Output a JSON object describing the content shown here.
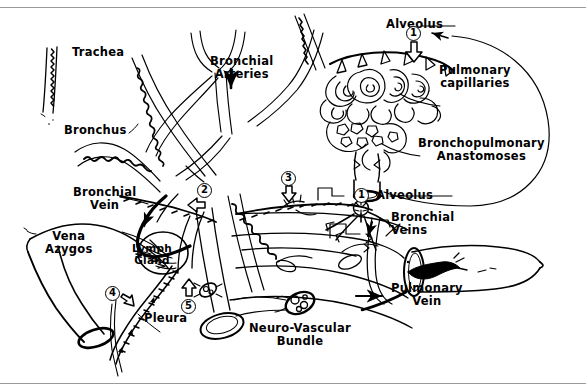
{
  "figure": {
    "kind": "anatomical-line-diagram",
    "stroke_color": "#000000",
    "background_color": "#ffffff",
    "rule_color": "#9a9a9a"
  },
  "labels": {
    "trachea": "Trachea",
    "bronchus": "Bronchus",
    "bronchial_arteries": "Bronchial\nArteries",
    "bronchial_vein": "Bronchial\nVein",
    "vena_azygos": "Vena\nAzygos",
    "lymph_gland": "Lymph\nGland",
    "pleura": "Pleura",
    "neuro_vascular_bundle": "Neuro-Vascular\nBundle",
    "alveolus_top": "Alveolus",
    "alveolus_mid": "Alveolus",
    "pulmonary_capillaries": "Pulmonary\ncapillaries",
    "bronchopulmonary_anastomoses": "Bronchopulmonary\nAnastomoses",
    "bronchial_veins": "Bronchial\nVeins",
    "pulmonary_vein": "Pulmonary\nVein"
  },
  "callouts": [
    {
      "id": "callout-1-top",
      "number": "1",
      "refers_to": "Alveolus"
    },
    {
      "id": "callout-1-mid",
      "number": "1",
      "refers_to": "Alveolus"
    },
    {
      "id": "callout-2",
      "number": "2",
      "refers_to": "Bronchial arterial supply to bronchial wall"
    },
    {
      "id": "callout-3",
      "number": "3",
      "refers_to": "Bronchial artery branch along bronchus"
    },
    {
      "id": "callout-4",
      "number": "4",
      "refers_to": "Pleural supply"
    },
    {
      "id": "callout-5",
      "number": "5",
      "refers_to": "Lymphatic drainage to lymph gland"
    }
  ],
  "icons": {
    "flow_arrow": "arrow-icon",
    "open_arrow": "open-arrow-icon"
  }
}
